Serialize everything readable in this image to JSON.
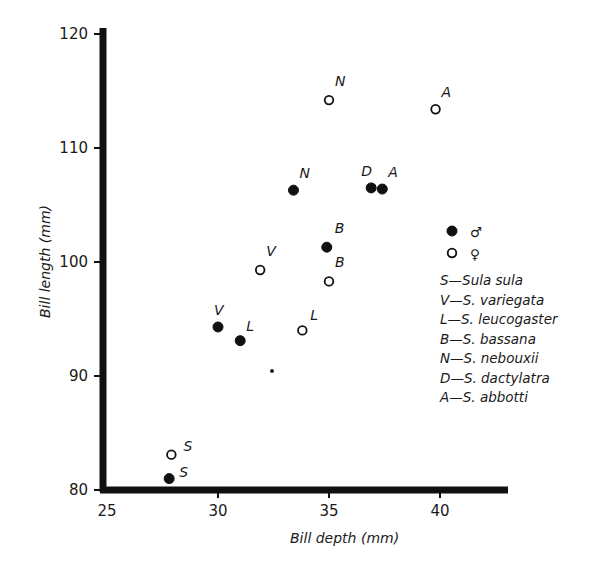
{
  "chart_data": {
    "type": "scatter",
    "title": "",
    "xlabel": "Bill depth (mm)",
    "ylabel": "Bill length (mm)",
    "xlim": [
      25,
      43
    ],
    "ylim": [
      80,
      120
    ],
    "xticks": [
      25,
      30,
      35,
      40
    ],
    "yticks": [
      80,
      90,
      100,
      110,
      120
    ],
    "grid": false,
    "legend_position": "right",
    "sex_legend": [
      {
        "marker": "filled",
        "symbol": "♂",
        "label": "male"
      },
      {
        "marker": "open",
        "symbol": "♀",
        "label": "female"
      }
    ],
    "species_legend": [
      {
        "code": "S",
        "text": "S—Sula sula"
      },
      {
        "code": "V",
        "text": "V—S. variegata"
      },
      {
        "code": "L",
        "text": "L—S. leucogaster"
      },
      {
        "code": "B",
        "text": "B—S. bassana"
      },
      {
        "code": "N",
        "text": "N—S. nebouxii"
      },
      {
        "code": "D",
        "text": "D—S. dactylatra"
      },
      {
        "code": "A",
        "text": "A—S. abbotti"
      }
    ],
    "series": [
      {
        "name": "male",
        "marker": "filled",
        "points": [
          {
            "label": "S",
            "x": 27.8,
            "y": 81.0
          },
          {
            "label": "V",
            "x": 30.0,
            "y": 94.3
          },
          {
            "label": "L",
            "x": 31.0,
            "y": 93.1
          },
          {
            "label": "B",
            "x": 34.9,
            "y": 101.3
          },
          {
            "label": "N",
            "x": 33.4,
            "y": 106.3
          },
          {
            "label": "D",
            "x": 36.9,
            "y": 106.5
          },
          {
            "label": "A",
            "x": 37.4,
            "y": 106.4
          }
        ]
      },
      {
        "name": "female",
        "marker": "open",
        "points": [
          {
            "label": "S",
            "x": 27.9,
            "y": 83.1
          },
          {
            "label": "V",
            "x": 31.9,
            "y": 99.3
          },
          {
            "label": "L",
            "x": 33.8,
            "y": 94.0
          },
          {
            "label": "B",
            "x": 35.0,
            "y": 98.3
          },
          {
            "label": "N",
            "x": 35.0,
            "y": 114.2
          },
          {
            "label": "A",
            "x": 39.8,
            "y": 113.4
          }
        ]
      }
    ]
  }
}
